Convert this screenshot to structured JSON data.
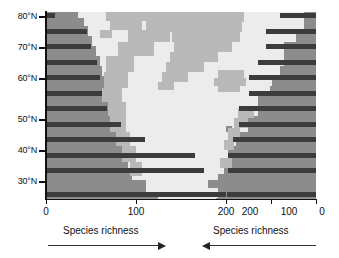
{
  "chart_data": {
    "type": "bar",
    "title": "",
    "subtitle": "",
    "orientation": "horizontal",
    "ylabel": "Latitude",
    "grid": false,
    "legend": null,
    "y_categories": [
      "80°N",
      "75°N",
      "70°N",
      "65°N",
      "60°N",
      "55°N",
      "50°N",
      "45°N",
      "40°N",
      "35°N",
      "30°N",
      "25°N"
    ],
    "y_tick_labels": [
      "80°N",
      "70°N",
      "60°N",
      "50°N",
      "40°N",
      "30°N"
    ],
    "panels": [
      {
        "name": "west",
        "xlabel": "Species richness",
        "arrow_direction": "right",
        "xticks": [
          0,
          100,
          200
        ],
        "xtick_labels": [
          "0",
          "100",
          "200"
        ],
        "xlim": [
          0,
          300
        ],
        "axis_reversed": false,
        "values": [
          10,
          45,
          50,
          57,
          60,
          62,
          68,
          83,
          110,
          165,
          175,
          200
        ]
      },
      {
        "name": "east",
        "xlabel": "Species richness",
        "arrow_direction": "left",
        "xticks": [
          200,
          100,
          0
        ],
        "xtick_labels": [
          "200",
          "100",
          "0"
        ],
        "xlim": [
          200,
          0
        ],
        "axis_reversed": true,
        "values": [
          80,
          112,
          112,
          130,
          150,
          150,
          172,
          172,
          185,
          195,
          195,
          198
        ]
      }
    ]
  },
  "map": {
    "ocean_color": "#8c8c8c",
    "land_color": "#b9b9b9",
    "ice_color": "#ececec",
    "bar_color": "#3c3c3c",
    "axis_color": "#111111"
  },
  "captions": {
    "left": "Species richness",
    "right": "Species richness"
  }
}
